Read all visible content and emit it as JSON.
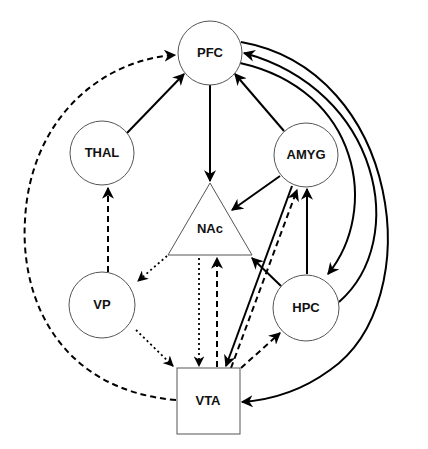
{
  "diagram": {
    "nodes": [
      {
        "id": "PFC",
        "label": "PFC",
        "shape": "circle",
        "cx": 210,
        "cy": 53,
        "r": 32
      },
      {
        "id": "THAL",
        "label": "THAL",
        "shape": "circle",
        "cx": 102,
        "cy": 153,
        "r": 32
      },
      {
        "id": "AMYG",
        "label": "AMYG",
        "shape": "circle",
        "cx": 306,
        "cy": 155,
        "r": 32
      },
      {
        "id": "NAc",
        "label": "NAc",
        "shape": "triangle",
        "points": "210,183 252,255 168,255"
      },
      {
        "id": "VP",
        "label": "VP",
        "shape": "circle",
        "cx": 102,
        "cy": 305,
        "r": 33
      },
      {
        "id": "HPC",
        "label": "HPC",
        "shape": "circle",
        "cx": 306,
        "cy": 308,
        "r": 33
      },
      {
        "id": "VTA",
        "label": "VTA",
        "shape": "rect",
        "x": 177,
        "y": 368,
        "w": 63,
        "h": 66
      }
    ],
    "edges": [
      {
        "from": "THAL",
        "to": "PFC",
        "style": "solid"
      },
      {
        "from": "PFC",
        "to": "NAc",
        "style": "solid"
      },
      {
        "from": "AMYG",
        "to": "PFC",
        "style": "solid"
      },
      {
        "from": "AMYG",
        "to": "NAc",
        "style": "solid"
      },
      {
        "from": "PFC",
        "to": "HPC",
        "style": "solid",
        "curve": "arc"
      },
      {
        "from": "HPC",
        "to": "PFC",
        "style": "solid",
        "curve": "arc"
      },
      {
        "from": "PFC",
        "to": "VTA",
        "style": "solid",
        "curve": "arc"
      },
      {
        "from": "VTA",
        "to": "PFC",
        "style": "dashed",
        "curve": "arc-left"
      },
      {
        "from": "VP",
        "to": "THAL",
        "style": "dashed"
      },
      {
        "from": "NAc",
        "to": "VP",
        "style": "dotted"
      },
      {
        "from": "VP",
        "to": "VTA",
        "style": "dotted"
      },
      {
        "from": "NAc",
        "to": "VTA",
        "style": "dotted"
      },
      {
        "from": "VTA",
        "to": "NAc",
        "style": "dashed"
      },
      {
        "from": "AMYG",
        "to": "VTA",
        "style": "solid"
      },
      {
        "from": "VTA",
        "to": "AMYG",
        "style": "dashed"
      },
      {
        "from": "HPC",
        "to": "AMYG",
        "style": "solid"
      },
      {
        "from": "HPC",
        "to": "NAc",
        "style": "solid"
      },
      {
        "from": "VTA",
        "to": "HPC",
        "style": "dashed"
      }
    ],
    "legend_styles": {
      "solid": "solid line",
      "dashed": "dashed line",
      "dotted": "dotted line"
    }
  },
  "labels": {
    "PFC": "PFC",
    "THAL": "THAL",
    "AMYG": "AMYG",
    "NAc": "NAc",
    "VP": "VP",
    "HPC": "HPC",
    "VTA": "VTA"
  },
  "colors": {
    "line": "#000000",
    "node_stroke": "#555555",
    "background": "#ffffff"
  }
}
